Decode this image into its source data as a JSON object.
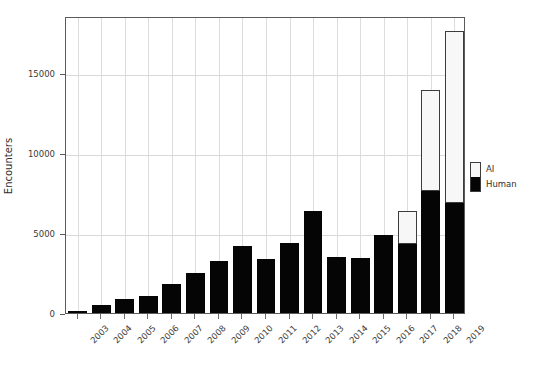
{
  "chart_data": {
    "type": "bar",
    "title": "",
    "subtitle": "",
    "xlabel": "",
    "ylabel": "Encounters",
    "stacked": true,
    "grid": true,
    "legend_position": "right",
    "ylim": [
      0,
      18700
    ],
    "yticks": [
      0,
      5000,
      10000,
      15000
    ],
    "ytick_labels": [
      "0",
      "5000",
      "10000",
      "15000"
    ],
    "categories": [
      "2003",
      "2004",
      "2005",
      "2006",
      "2007",
      "2008",
      "2009",
      "2010",
      "2011",
      "2012",
      "2013",
      "2014",
      "2015",
      "2016",
      "2017",
      "2018",
      "2019"
    ],
    "series": [
      {
        "name": "Human",
        "color": "#050505",
        "values": [
          150,
          500,
          900,
          1050,
          1800,
          2500,
          3250,
          4200,
          3400,
          4350,
          6375,
          3500,
          3450,
          4850,
          4300,
          7625,
          6875
        ]
      },
      {
        "name": "AI",
        "color": "#f7f7f7",
        "values": [
          0,
          0,
          0,
          0,
          0,
          0,
          0,
          0,
          0,
          0,
          0,
          0,
          0,
          0,
          2075,
          6315,
          10750
        ]
      }
    ],
    "totals": [
      150,
      500,
      900,
      1050,
      1800,
      2500,
      3250,
      4200,
      3400,
      4350,
      6375,
      3500,
      3450,
      4850,
      6375,
      13940,
      17625
    ]
  },
  "legend": {
    "entries": [
      {
        "label": "AI",
        "swatch": "ai"
      },
      {
        "label": "Human",
        "swatch": "human"
      }
    ]
  },
  "colors": {
    "human": "#050505",
    "ai": "#f7f7f7",
    "frame": "#5a5a5a",
    "grid": "#d9d9d9",
    "text": "#3a3a3a",
    "background": "#ffffff"
  }
}
